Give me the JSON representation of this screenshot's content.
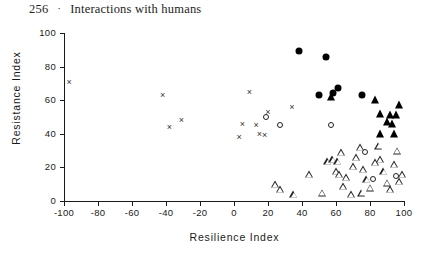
{
  "page": {
    "number": "256",
    "separator": "·",
    "running_head": "Interactions with humans"
  },
  "chart_data": {
    "type": "scatter",
    "title": "",
    "xlabel": "Resilience Index",
    "ylabel": "Resistance Index",
    "xlim": [
      -100,
      100
    ],
    "ylim": [
      0,
      100
    ],
    "xticks": [
      -100,
      -80,
      -60,
      -40,
      -20,
      0,
      20,
      40,
      60,
      80,
      100
    ],
    "xtick_labels": [
      "-100",
      "-80",
      "-60",
      "-40",
      "-20",
      "0",
      "20",
      "40",
      "60",
      "80",
      "100"
    ],
    "yticks": [
      0,
      20,
      40,
      60,
      80,
      100
    ],
    "ytick_labels": [
      "0",
      "20",
      "40",
      "60",
      "80",
      "100"
    ],
    "grid": false,
    "legend": null,
    "series": [
      {
        "name": "cross",
        "marker": "x",
        "fill": "open",
        "points": [
          [
            -97,
            71
          ],
          [
            -42,
            63
          ],
          [
            -38,
            44
          ],
          [
            -31,
            48
          ],
          [
            3,
            38
          ],
          [
            5,
            46
          ],
          [
            9,
            65
          ],
          [
            13,
            45
          ],
          [
            15,
            40
          ],
          [
            18,
            39
          ],
          [
            20,
            53
          ],
          [
            34,
            56
          ]
        ]
      },
      {
        "name": "open-circle",
        "marker": "circle",
        "fill": "open",
        "points": [
          [
            19,
            50
          ],
          [
            27,
            45
          ],
          [
            57,
            45
          ],
          [
            77,
            29
          ],
          [
            82,
            13
          ],
          [
            95,
            15
          ]
        ]
      },
      {
        "name": "filled-circle",
        "marker": "circle",
        "fill": "filled",
        "points": [
          [
            38,
            89
          ],
          [
            54,
            86
          ],
          [
            50,
            63
          ],
          [
            58,
            64
          ],
          [
            61,
            67
          ],
          [
            75,
            63
          ]
        ]
      },
      {
        "name": "filled-triangle",
        "marker": "triangle",
        "fill": "filled",
        "points": [
          [
            57,
            62
          ],
          [
            83,
            60
          ],
          [
            86,
            52
          ],
          [
            92,
            51
          ],
          [
            95,
            51
          ],
          [
            90,
            47
          ],
          [
            93,
            46
          ],
          [
            86,
            40
          ],
          [
            94,
            40
          ],
          [
            97,
            57
          ]
        ]
      },
      {
        "name": "open-triangle",
        "marker": "triangle",
        "fill": "open",
        "points": [
          [
            24,
            10
          ],
          [
            27,
            7
          ],
          [
            35,
            4
          ],
          [
            44,
            16
          ],
          [
            55,
            24
          ],
          [
            58,
            25
          ],
          [
            61,
            24
          ],
          [
            63,
            29
          ],
          [
            60,
            18
          ],
          [
            62,
            16
          ],
          [
            66,
            14
          ],
          [
            64,
            9
          ],
          [
            70,
            21
          ],
          [
            72,
            26
          ],
          [
            74,
            32
          ],
          [
            76,
            19
          ],
          [
            78,
            13
          ],
          [
            80,
            8
          ],
          [
            83,
            23
          ],
          [
            85,
            33
          ],
          [
            86,
            25
          ],
          [
            88,
            18
          ],
          [
            90,
            11
          ],
          [
            92,
            7
          ],
          [
            94,
            22
          ],
          [
            96,
            30
          ],
          [
            97,
            12
          ],
          [
            99,
            16
          ],
          [
            52,
            5
          ],
          [
            69,
            4
          ],
          [
            75,
            5
          ]
        ]
      }
    ]
  }
}
